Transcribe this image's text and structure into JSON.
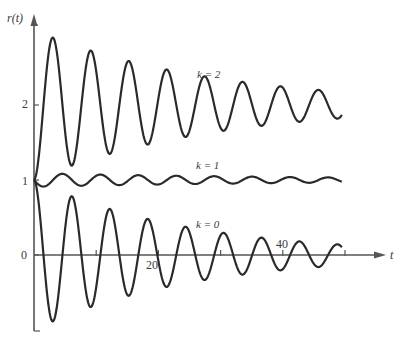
{
  "chart_data": {
    "type": "line",
    "title": "",
    "xlabel": "t",
    "ylabel": "r(t)",
    "xlim": [
      0,
      55
    ],
    "ylim": [
      -1.0,
      3.1
    ],
    "x_ticks": [
      {
        "value": 10,
        "label": ""
      },
      {
        "value": 20,
        "label": "20"
      },
      {
        "value": 30,
        "label": ""
      },
      {
        "value": 40,
        "label": "40"
      },
      {
        "value": 50,
        "label": ""
      }
    ],
    "y_ticks": [
      {
        "value": 0,
        "label": "0"
      },
      {
        "value": 1,
        "label": "1"
      },
      {
        "value": 2,
        "label": "2"
      }
    ],
    "grid": false,
    "legend": "inline annotations",
    "series": [
      {
        "name": "k = 2",
        "label_pos": {
          "t": 28.5,
          "r": 2.45
        },
        "model": {
          "offset": 2,
          "amp": -1,
          "decay": 0.035,
          "omega": 1.03,
          "fn": "cos"
        },
        "t": [
          0,
          3,
          6,
          9,
          12,
          15,
          18,
          21,
          24,
          27,
          30,
          33,
          36,
          39,
          42,
          45,
          48,
          49.5
        ],
        "values": [
          1.0,
          2.89,
          1.19,
          2.73,
          1.34,
          2.59,
          1.47,
          2.48,
          1.57,
          2.39,
          1.65,
          2.31,
          1.72,
          2.25,
          1.78,
          2.2,
          1.82,
          1.96
        ]
      },
      {
        "name": "k = 1",
        "label_pos": {
          "t": 23.5,
          "r": 1.22
        },
        "model": {
          "offset": 1,
          "amp": -0.09,
          "decay": 0.02,
          "omega": 1.03,
          "fn": "sin"
        },
        "t": [
          0,
          1.5,
          4.6,
          7.6,
          10.7,
          13.7,
          16.8,
          19.8,
          22.9,
          25.9,
          29,
          32,
          35,
          38,
          41,
          44,
          47,
          49.5
        ],
        "values": [
          1.0,
          0.92,
          1.08,
          0.93,
          1.07,
          0.94,
          1.06,
          0.95,
          1.06,
          0.95,
          1.05,
          0.96,
          1.04,
          0.96,
          1.04,
          0.97,
          1.03,
          1.02
        ]
      },
      {
        "name": "k = 0",
        "label_pos": {
          "t": 24,
          "r": 0.42
        },
        "model": {
          "offset": 0,
          "amp": 1,
          "decay": 0.04,
          "omega": 1.03,
          "fn": "cos"
        },
        "t": [
          0,
          3,
          6,
          9,
          12,
          15,
          18,
          21,
          24,
          27,
          30,
          33,
          36,
          39,
          42,
          45,
          48,
          50
        ],
        "values": [
          1.0,
          -0.88,
          0.78,
          -0.69,
          0.61,
          -0.54,
          0.48,
          -0.42,
          0.37,
          -0.33,
          0.29,
          -0.26,
          0.23,
          -0.2,
          0.18,
          -0.16,
          0.14,
          0.08
        ]
      }
    ]
  },
  "plot": {
    "origin_px": {
      "x": 34,
      "y": 255
    },
    "px_per_t": 6.22,
    "px_per_r": 75,
    "t_end": 49.6,
    "line_color": "#2a2a2a",
    "axis_color": "#555555"
  },
  "labels": {
    "y_axis": "r(t)",
    "x_axis": "t",
    "k2": "k = 2",
    "k1": "k = 1",
    "k0": "k = 0",
    "tick_0": "0",
    "tick_1": "1",
    "tick_2": "2",
    "tick_20": "20",
    "tick_40": "40"
  }
}
